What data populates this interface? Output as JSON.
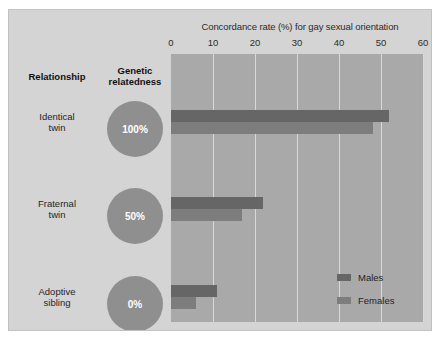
{
  "chart_data": {
    "type": "bar",
    "orientation": "horizontal",
    "title": "Concordance rate (%) for gay sexual orientation",
    "xlabel": "",
    "ylabel": "",
    "xlim": [
      0,
      60
    ],
    "xticks": [
      0,
      10,
      20,
      30,
      40,
      50,
      60
    ],
    "xtick_labels": [
      "0",
      "10",
      "20",
      "30",
      "40",
      "50",
      "60"
    ],
    "grid": "vertical",
    "legend_position": "inside-bottom-right",
    "categories": [
      "Identical twin",
      "Fraternal twin",
      "Adoptive sibling"
    ],
    "series": [
      {
        "name": "Males",
        "color": "#666666",
        "values": [
          52,
          22,
          11
        ]
      },
      {
        "name": "Females",
        "color": "#7d7d7d",
        "values": [
          48,
          17,
          6
        ]
      }
    ]
  },
  "table": {
    "headers": {
      "relationship": "Relationship",
      "relatedness_line1": "Genetic",
      "relatedness_line2": "relatedness"
    },
    "rows": [
      {
        "label_line1": "Identical",
        "label_line2": "twin",
        "relatedness": "100%"
      },
      {
        "label_line1": "Fraternal",
        "label_line2": "twin",
        "relatedness": "50%"
      },
      {
        "label_line1": "Adoptive",
        "label_line2": "sibling",
        "relatedness": "0%"
      }
    ]
  },
  "legend": {
    "items": [
      {
        "label": "Males"
      },
      {
        "label": "Females"
      }
    ]
  },
  "colors": {
    "panel_background": "#d4d4d4",
    "plot_background": "#a9a9a9",
    "gridline": "#d8d8d8",
    "males_bar": "#666666",
    "females_bar": "#7d7d7d",
    "circle": "#8f8f8f"
  }
}
